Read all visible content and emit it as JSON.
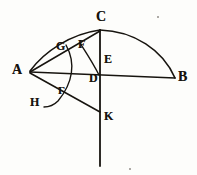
{
  "figure": {
    "ink_color": "#17140f",
    "paper_color": "#fdfdfb",
    "width": 197,
    "height": 175,
    "points": [
      {
        "id": "A",
        "label": "A",
        "x": 30,
        "y": 72,
        "label_x": 12,
        "label_y": 63,
        "size": "lbl-lg"
      },
      {
        "id": "B",
        "label": "B",
        "x": 175,
        "y": 78,
        "label_x": 178,
        "label_y": 70,
        "size": "lbl-lg"
      },
      {
        "id": "C",
        "label": "C",
        "x": 100,
        "y": 30,
        "label_x": 96,
        "label_y": 10,
        "size": "lbl-lg"
      },
      {
        "id": "D",
        "label": "D",
        "x": 100,
        "y": 78,
        "label_x": 89,
        "label_y": 72,
        "size": "lbl-md"
      },
      {
        "id": "E",
        "label": "E",
        "x": 100,
        "y": 62,
        "label_x": 104,
        "label_y": 53,
        "size": "lbl-md"
      },
      {
        "id": "F",
        "label": "F",
        "x": 83,
        "y": 46,
        "label_x": 78,
        "label_y": 38,
        "size": "lbl-md"
      },
      {
        "id": "G",
        "label": "G",
        "x": 62,
        "y": 48,
        "label_x": 56,
        "label_y": 40,
        "size": "lbl-md"
      },
      {
        "id": "H",
        "label": "H",
        "x": 44,
        "y": 104,
        "label_x": 30,
        "label_y": 96,
        "size": "lbl-md"
      },
      {
        "id": "K",
        "label": "K",
        "x": 100,
        "y": 112,
        "label_x": 104,
        "label_y": 110,
        "size": "lbl-md"
      },
      {
        "id": "Gamma",
        "label": "Γ",
        "x": 70,
        "y": 92,
        "label_x": 58,
        "label_y": 85,
        "size": "lbl-sm"
      }
    ],
    "segments": [
      {
        "id": "A-B",
        "name": "segment-ab",
        "from": "A",
        "to": "B"
      },
      {
        "id": "A-C",
        "name": "segment-ac",
        "from": "A",
        "to": "C"
      },
      {
        "id": "C-K",
        "name": "segment-ck-vertical",
        "from": "C",
        "to": "K"
      },
      {
        "id": "K-tail",
        "name": "segment-vertical-tail",
        "from": "K",
        "to": "bottom"
      },
      {
        "id": "A-K",
        "name": "segment-ak",
        "from": "A",
        "to": "K"
      }
    ],
    "arcs": [
      {
        "id": "arc-C-B",
        "name": "arc-cb-outer",
        "from": "C",
        "to": "B",
        "note": "large outer arc right of C"
      },
      {
        "id": "arc-A-C",
        "name": "arc-ac-outer",
        "from": "A",
        "to": "C",
        "note": "outer arc left of C passing above G"
      },
      {
        "id": "arc-F-D",
        "name": "arc-fd-inner",
        "from": "F",
        "to": "D",
        "note": "inner arc near C-D line"
      },
      {
        "id": "arc-G-H",
        "name": "arc-g-gamma-h",
        "from": "G",
        "to": "H",
        "note": "arc centred on A through Gamma"
      }
    ],
    "specks": [
      {
        "x": 157,
        "y": 16,
        "d": 2
      },
      {
        "x": 129,
        "y": 168,
        "d": 2
      }
    ]
  }
}
